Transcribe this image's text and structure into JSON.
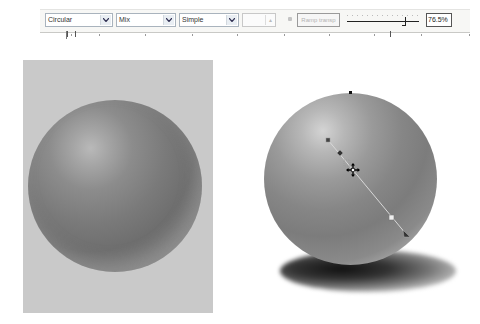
{
  "toolbar": {
    "fill_type": {
      "selected": "Circular",
      "icon": "chevron-down-icon"
    },
    "blend_mode": {
      "selected": "Mix",
      "icon": "chevron-down-icon"
    },
    "style": {
      "selected": "Simple",
      "icon": "chevron-down-icon"
    },
    "spinner": {
      "value": "",
      "enabled": false,
      "icon": "spinner-arrows-icon"
    },
    "small_icon": "node-icon",
    "ramp_button": {
      "label": "Ramp transp",
      "enabled": false
    },
    "slider": {
      "label": "transparency-midpoint",
      "position_pct": 76.5
    },
    "percent_field": {
      "value": "76.5%"
    }
  },
  "ruler": {
    "ticks": [
      0,
      32,
      78,
      125,
      170,
      217,
      262,
      307,
      323,
      354,
      402
    ]
  },
  "canvas": {
    "left_panel": {
      "background": "#c9c9c9",
      "object": "shaded-sphere"
    },
    "right_object": {
      "object": "shaded-sphere-with-shadow",
      "gradient_handles": {
        "start_square": [
          328,
          140
        ],
        "midpoint_diamond": [
          340,
          153
        ],
        "checker_node": [
          347,
          163
        ],
        "move_cursor": [
          353,
          170
        ],
        "end_square": [
          391,
          217
        ],
        "end_arrow": [
          406,
          234
        ],
        "top_node": [
          350,
          93
        ]
      }
    }
  },
  "colors": {
    "toolbar_bg": "#f7f7f5",
    "dropdown_border": "#a9b3bd",
    "panel_bg": "#c9c9c9",
    "handle_line": "#d8d8d8"
  }
}
